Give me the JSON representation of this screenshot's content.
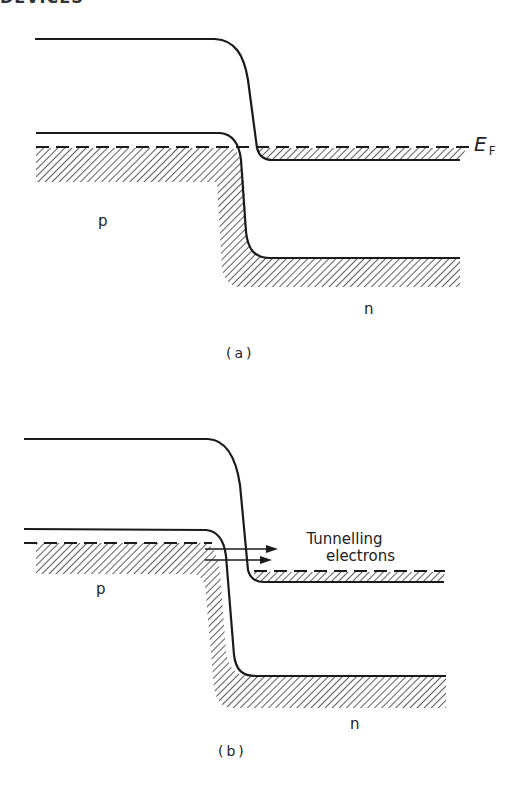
{
  "header": {
    "partial_text": "DEVICES"
  },
  "panel_a": {
    "caption": "(a)",
    "labels": {
      "p": "p",
      "n": "n",
      "fermi_main": "E",
      "fermi_sub": "F"
    }
  },
  "panel_b": {
    "caption": "(b)",
    "labels": {
      "p": "p",
      "n": "n",
      "tunnelling_line1": "Tunnelling",
      "tunnelling_line2": "electrons"
    }
  },
  "colors": {
    "ink": "#1a1a1a",
    "hatch": "#333333",
    "background": "#ffffff"
  }
}
